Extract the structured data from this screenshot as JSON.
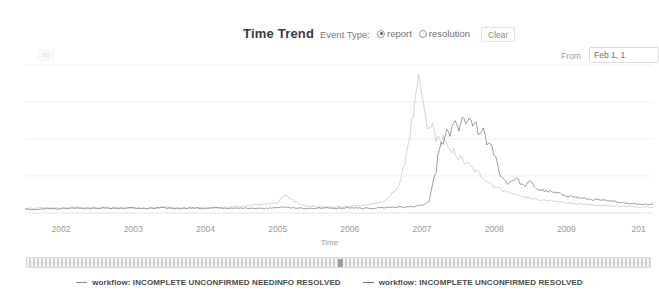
{
  "header": {
    "title": "Time Trend",
    "event_type_label": "Event Type:",
    "options": [
      {
        "label": "report",
        "selected": true
      },
      {
        "label": "resolution",
        "selected": false
      }
    ],
    "clear_label": "Clear"
  },
  "toolbar": {
    "ghost_label": "All",
    "from_label": "From",
    "from_value": "Feb 1, 1",
    "from_placeholder": "Feb 1, 1"
  },
  "chart_data": {
    "type": "line",
    "title": "Time Trend",
    "xlabel": "Time",
    "ylabel": "",
    "grid": true,
    "legend_position": "bottom",
    "xlim": [
      2001.5,
      2010.2
    ],
    "ylim": [
      0,
      100
    ],
    "xticks": [
      "2002",
      "2003",
      "2004",
      "2005",
      "2006",
      "2007",
      "2008",
      "2009",
      "201"
    ],
    "xtick_positions": [
      2002,
      2003,
      2004,
      2005,
      2006,
      2007,
      2008,
      2009,
      2010
    ],
    "yticks": [],
    "gridlines_y": [
      25,
      50,
      75,
      100
    ],
    "series": [
      {
        "name": "workflow: INCOMPLETE UNCONFIRMED NEEDINFO RESOLVED",
        "color": "#8c8c8c",
        "x": [
          2001.6,
          2001.8,
          2002.0,
          2002.2,
          2002.4,
          2002.6,
          2002.8,
          2003.0,
          2003.2,
          2003.4,
          2003.6,
          2003.8,
          2004.0,
          2004.2,
          2004.4,
          2004.6,
          2004.8,
          2005.0,
          2005.1,
          2005.2,
          2005.3,
          2005.4,
          2005.5,
          2005.6,
          2005.7,
          2005.9,
          2006.1,
          2006.3,
          2006.5,
          2006.7,
          2006.8,
          2006.9,
          2006.95,
          2007.0,
          2007.05,
          2007.1,
          2007.15,
          2007.2,
          2007.25,
          2007.3,
          2007.35,
          2007.4,
          2007.45,
          2007.5,
          2007.6,
          2007.7,
          2007.8,
          2007.9,
          2008.0,
          2008.2,
          2008.4,
          2008.6,
          2008.8,
          2009.0,
          2009.2,
          2009.4,
          2009.6,
          2009.8,
          2010.0
        ],
        "y": [
          3,
          3.5,
          3,
          4,
          3.5,
          3,
          4,
          3.5,
          3,
          4,
          3.5,
          3,
          4,
          3.5,
          4,
          5,
          6,
          7,
          12,
          9,
          6,
          5,
          4.5,
          4,
          4,
          4,
          5,
          6,
          8,
          20,
          45,
          72,
          88,
          80,
          62,
          55,
          60,
          50,
          48,
          52,
          44,
          40,
          42,
          38,
          34,
          30,
          26,
          22,
          18,
          14,
          11,
          9,
          8,
          7,
          6,
          5,
          5,
          4.5,
          4
        ]
      },
      {
        "name": "workflow: INCOMPLETE UNCONFIRMED RESOLVED",
        "color": "#6f6f6f",
        "x": [
          2001.6,
          2001.8,
          2002.0,
          2002.2,
          2002.4,
          2002.6,
          2002.8,
          2003.0,
          2003.2,
          2003.4,
          2003.6,
          2003.8,
          2004.0,
          2004.2,
          2004.4,
          2004.6,
          2004.8,
          2005.0,
          2005.2,
          2005.4,
          2005.6,
          2005.8,
          2006.0,
          2006.2,
          2006.4,
          2006.6,
          2006.8,
          2007.0,
          2007.1,
          2007.2,
          2007.25,
          2007.3,
          2007.35,
          2007.4,
          2007.45,
          2007.5,
          2007.55,
          2007.6,
          2007.65,
          2007.7,
          2007.75,
          2007.8,
          2007.85,
          2007.9,
          2007.95,
          2008.0,
          2008.1,
          2008.2,
          2008.3,
          2008.4,
          2008.5,
          2008.6,
          2008.8,
          2009.0,
          2009.2,
          2009.4,
          2009.6,
          2009.8,
          2010.0
        ],
        "y": [
          2.5,
          3,
          3,
          3.5,
          3,
          3.5,
          3,
          3.5,
          3,
          3.5,
          3,
          3.5,
          3,
          3.5,
          3,
          3.5,
          3,
          4,
          3.5,
          3,
          3.5,
          3,
          3.5,
          3,
          3.5,
          4,
          4,
          5,
          8,
          30,
          48,
          44,
          58,
          52,
          62,
          56,
          64,
          58,
          66,
          55,
          62,
          50,
          58,
          48,
          44,
          40,
          24,
          20,
          24,
          18,
          21,
          16,
          14,
          12,
          10,
          9,
          8,
          7,
          6
        ]
      }
    ]
  },
  "slider": {
    "handle_left": "0",
    "handle_right": "100"
  },
  "legend": [
    {
      "label": "workflow: INCOMPLETE UNCONFIRMED NEEDINFO RESOLVED"
    },
    {
      "label": "workflow: INCOMPLETE UNCONFIRMED RESOLVED"
    }
  ]
}
